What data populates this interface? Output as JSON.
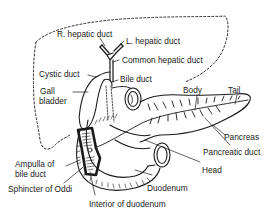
{
  "diagram": {
    "type": "anatomical-illustration",
    "colors": {
      "ink": "#1a1a1a",
      "background": "#ffffff"
    },
    "labels": {
      "r_hepatic_duct": "R. hepatic duct",
      "l_hepatic_duct": "L. hepatic duct",
      "common_hepatic_duct": "Common hepatic duct",
      "cystic_duct": "Cystic duct",
      "bile_duct": "Bile duct",
      "gall": "Gall",
      "bladder": "bladder",
      "body": "Body",
      "tail": "Tail",
      "pancreas": "Pancreas",
      "pancreatic_duct": "Pancreatic duct",
      "head": "Head",
      "ampulla_line1": "Ampulla of",
      "ampulla_line2": "bile duct",
      "duodenum": "Duodenum",
      "sphincter_of_oddi": "Sphincter of Oddi",
      "interior_of_duodenum": "Interior of duodenum"
    },
    "structures": [
      "liver-outline",
      "hepatic-ducts",
      "gall-bladder",
      "bile-duct",
      "pancreas",
      "pancreatic-duct",
      "duodenum",
      "ampulla",
      "sphincter-of-oddi"
    ]
  }
}
